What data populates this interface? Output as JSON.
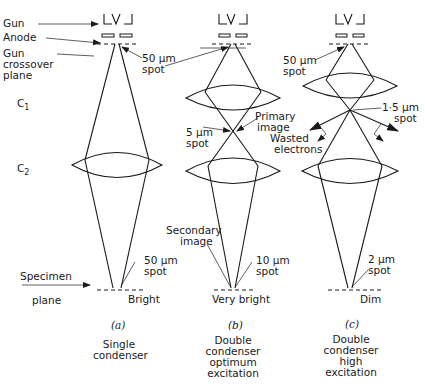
{
  "labels": {
    "gun": "Gun",
    "anode": "Anode",
    "gun_crossover_line1": "Gun",
    "gun_crossover_line2": "crossover",
    "gun_crossover_line3": "plane",
    "c1": "C",
    "c1_sub": "1",
    "c2": "C",
    "c2_sub": "2",
    "specimen": "Specimen",
    "plane": "plane"
  },
  "panels": [
    {
      "id": "a",
      "letter": "(a)",
      "caption": [
        "Single",
        "condenser"
      ],
      "source_spot": [
        "50 μm",
        "spot"
      ],
      "final_spot": [
        "50 μm",
        "spot"
      ],
      "brightness": "Bright"
    },
    {
      "id": "b",
      "letter": "(b)",
      "caption": [
        "Double",
        "condenser",
        "optimum",
        "excitation"
      ],
      "intermediate_spot": [
        "5 μm",
        "spot"
      ],
      "primary_image": [
        "Primary",
        "image"
      ],
      "secondary_image": [
        "Secondary",
        "image"
      ],
      "final_spot": [
        "10 μm",
        "spot"
      ],
      "brightness": "Very bright"
    },
    {
      "id": "c",
      "letter": "(c)",
      "caption": [
        "Double",
        "condenser",
        "high",
        "excitation"
      ],
      "source_spot": [
        "50 μm",
        "spot"
      ],
      "intermediate_spot": [
        "1·5 μm",
        "spot"
      ],
      "wasted": [
        "Wasted",
        "electrons"
      ],
      "final_spot": [
        "2 μm",
        "spot"
      ],
      "brightness": "Dim"
    }
  ],
  "gun_glyph": "└V┘"
}
